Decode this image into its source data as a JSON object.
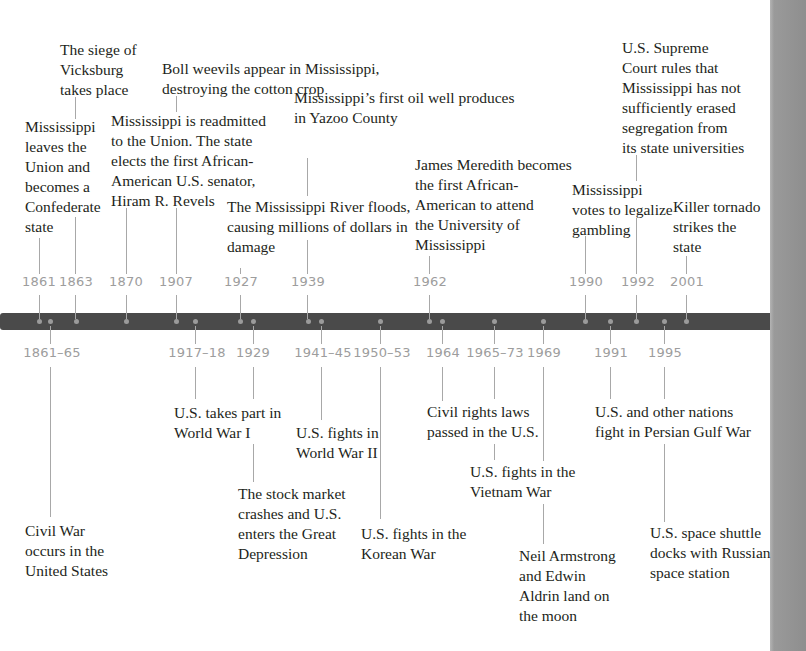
{
  "timeline": {
    "bar_color": "#4a4a4a",
    "year_color": "#9d9d9d",
    "above": [
      {
        "year": "1861",
        "text": "Mississippi\nleaves the\nUnion and\nbecomes a\nConfederate\nstate"
      },
      {
        "year": "1863",
        "text": "The siege of\nVicksburg\ntakes place"
      },
      {
        "year": "1870",
        "text": "Mississippi is readmitted\nto the Union. The state\nelects the first African-\nAmerican U.S. senator,\nHiram R. Revels"
      },
      {
        "year": "1907",
        "text": "Boll weevils appear in Mississippi,\ndestroying the cotton crop"
      },
      {
        "year": "1927",
        "text": "The Mississippi River floods,\ncausing millions of dollars in\ndamage"
      },
      {
        "year": "1939",
        "text": "Mississippi’s first oil well produces\nin Yazoo County"
      },
      {
        "year": "1962",
        "text": "James Meredith becomes\nthe first African-\nAmerican to attend\nthe University of\nMississippi"
      },
      {
        "year": "1990",
        "text": "Mississippi\nvotes to legalize\ngambling"
      },
      {
        "year": "1992",
        "text": "U.S. Supreme\nCourt rules that\nMississippi has not\nsufficiently erased\nsegregation from\nits state universities"
      },
      {
        "year": "2001",
        "text": "Killer tornado\nstrikes the\nstate"
      }
    ],
    "below": [
      {
        "year": "1861–65",
        "text": "Civil War\noccurs in the\nUnited States"
      },
      {
        "year": "1917–18",
        "text": "U.S. takes part in\nWorld War I"
      },
      {
        "year": "1929",
        "text": "The stock market\ncrashes and U.S.\nenters the Great\nDepression"
      },
      {
        "year": "1941–45",
        "text": "U.S. fights in\nWorld War II"
      },
      {
        "year": "1950–53",
        "text": "U.S. fights in the\nKorean War"
      },
      {
        "year": "1964",
        "text": "Civil rights laws\npassed in the U.S."
      },
      {
        "year": "1965–73",
        "text": "U.S. fights in the\nVietnam War"
      },
      {
        "year": "1969",
        "text": "Neil Armstrong\nand Edwin\nAldrin land on\nthe moon"
      },
      {
        "year": "1991",
        "text": "U.S. and other nations\nfight in Persian Gulf War"
      },
      {
        "year": "1995",
        "text": "U.S. space shuttle\ndocks with Russian\nspace station"
      }
    ]
  }
}
